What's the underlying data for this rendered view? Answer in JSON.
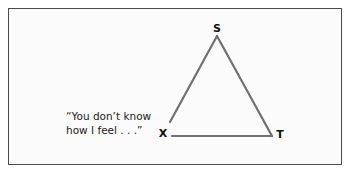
{
  "diagram": {
    "type": "triangle",
    "vertices": {
      "S": {
        "label": "S",
        "x": 217,
        "y": 36
      },
      "X": {
        "label": "X",
        "x": 170,
        "y": 121
      },
      "T": {
        "label": "T",
        "x": 272,
        "y": 136
      }
    },
    "base_left": {
      "x": 172,
      "y": 136
    },
    "edges": [
      {
        "from": "S",
        "to": "X"
      },
      {
        "from": "S",
        "to": "T"
      },
      {
        "from": "X",
        "to": "T"
      }
    ],
    "edge_color": "#707070",
    "frame_color": "#4a4a4a",
    "quote": {
      "line1": "“You don’t know",
      "line2": "how I feel . . .”"
    }
  }
}
